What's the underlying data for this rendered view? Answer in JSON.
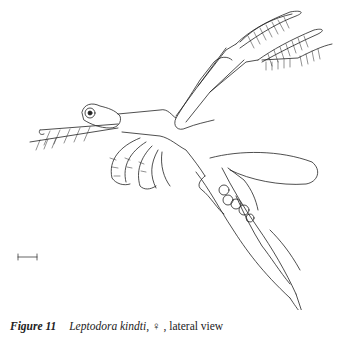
{
  "figure": {
    "label": "Figure 11",
    "species": "Leptodora kindti",
    "sex_symbol": ", ♀ , ",
    "view": "lateral view",
    "scale_bar": "scale-bar"
  }
}
